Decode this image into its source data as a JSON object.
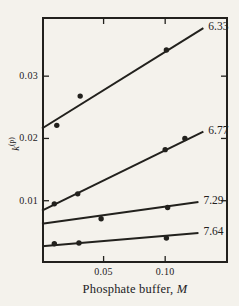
{
  "figure": {
    "background": "#f4f2ec",
    "ink": "#22211d"
  },
  "chart_data": {
    "type": "scatter",
    "title": "",
    "xlabel": "Phosphate buffer, M",
    "xlabel_parts": {
      "prefix": "Phosphate buffer, ",
      "unit": "M"
    },
    "ylabel": "k(p)",
    "ylabel_parts": {
      "base": "k",
      "sup": "(p)"
    },
    "xlim": [
      0,
      0.151
    ],
    "ylim": [
      0,
      0.0395
    ],
    "grid": false,
    "legend_position": "line-end-labels",
    "marker": "filled-circle",
    "xticks": [
      {
        "value": 0.05,
        "label": "0.05"
      },
      {
        "value": 0.1,
        "label": "0.10"
      }
    ],
    "yticks": [
      {
        "value": 0.01,
        "label": "0.01"
      },
      {
        "value": 0.02,
        "label": "0.02"
      },
      {
        "value": 0.03,
        "label": "0.03"
      }
    ],
    "series": [
      {
        "label": "6.33",
        "points": [
          [
            0.012,
            0.0221
          ],
          [
            0.031,
            0.0268
          ],
          [
            0.101,
            0.0342
          ]
        ],
        "fit_line": [
          [
            0,
            0.0216
          ],
          [
            0.131,
            0.0377
          ]
        ]
      },
      {
        "label": "6.77",
        "points": [
          [
            0.01,
            0.0095
          ],
          [
            0.029,
            0.0111
          ],
          [
            0.1,
            0.0182
          ],
          [
            0.116,
            0.02
          ]
        ],
        "fit_line": [
          [
            0,
            0.0084
          ],
          [
            0.131,
            0.0211
          ]
        ]
      },
      {
        "label": "7.29",
        "points": [
          [
            0.048,
            0.0071
          ],
          [
            0.102,
            0.0089
          ]
        ],
        "fit_line": [
          [
            0,
            0.0063
          ],
          [
            0.127,
            0.0098
          ]
        ]
      },
      {
        "label": "7.64",
        "points": [
          [
            0.01,
            0.0031
          ],
          [
            0.03,
            0.0032
          ],
          [
            0.101,
            0.004
          ]
        ],
        "fit_line": [
          [
            0,
            0.0027
          ],
          [
            0.127,
            0.0048
          ]
        ]
      }
    ]
  }
}
